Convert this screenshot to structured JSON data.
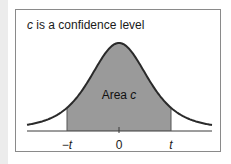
{
  "caption": {
    "variable": "c",
    "text": " is a confidence level"
  },
  "area_label": {
    "prefix": "Area ",
    "variable": "c"
  },
  "ticks": [
    {
      "label": "−t",
      "x": 67
    },
    {
      "label": "0",
      "x": 119
    },
    {
      "label": "t",
      "x": 171
    }
  ],
  "colors": {
    "curve": "#2a2a2a",
    "shade": "#9a9a9a",
    "axis": "#3a3a3a",
    "frame": "#8a8a8a"
  },
  "chart_data": {
    "type": "area",
    "title": "c is a confidence level",
    "distribution": "t-distribution (bell curve)",
    "xlabel": "",
    "ylabel": "",
    "tick_labels": [
      "−t",
      "0",
      "t"
    ],
    "shaded_region": {
      "from": "−t",
      "to": "t",
      "label": "Area c"
    },
    "annotations": [
      "Area c"
    ],
    "grid": false,
    "legend": null,
    "geometry": {
      "axis_y": 131,
      "x_start": 27,
      "x_end": 212,
      "center_x": 119,
      "peak_y": 43,
      "neg_t_x": 67,
      "pos_t_x": 171
    }
  }
}
